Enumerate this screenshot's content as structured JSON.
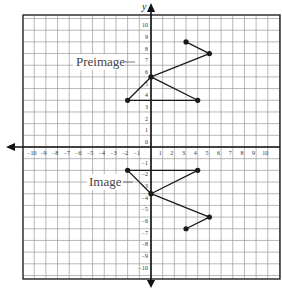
{
  "graph": {
    "x_axis_label": "",
    "y_axis_label": "y",
    "x_tick_labels": [
      "-10",
      "-9",
      "-8",
      "-7",
      "-6",
      "-5",
      "-4",
      "-3",
      "-2",
      "-1",
      "1",
      "2",
      "3",
      "4",
      "5",
      "6",
      "7",
      "8",
      "9",
      "10"
    ],
    "y_tick_labels_positive": [
      "10",
      "9",
      "8",
      "7",
      "6",
      "5",
      "4",
      "3",
      "2",
      "1",
      "0"
    ],
    "y_tick_labels_negative": [
      "-1",
      "-2",
      "-3",
      "-4",
      "-5",
      "-6",
      "-7",
      "-8",
      "-9",
      "-10"
    ],
    "preimage_label": "Preimage",
    "image_label": "Image",
    "line_color": "#1a1a1a",
    "grid_color": "#9a9a9a",
    "border_color": "#222222"
  },
  "chart_data": {
    "type": "line",
    "title": "",
    "xlabel": "",
    "ylabel": "y",
    "xlim": [
      -10,
      10
    ],
    "ylim": [
      -10,
      10
    ],
    "grid": true,
    "series": [
      {
        "name": "Preimage",
        "points": [
          [
            3,
            9
          ],
          [
            5,
            8
          ],
          [
            0,
            6
          ],
          [
            4,
            4
          ],
          [
            -2,
            4
          ],
          [
            0,
            6
          ]
        ]
      },
      {
        "name": "Image",
        "points": [
          [
            3,
            -7
          ],
          [
            5,
            -6
          ],
          [
            0,
            -4
          ],
          [
            4,
            -2
          ],
          [
            -2,
            -2
          ],
          [
            0,
            -4
          ]
        ]
      }
    ],
    "annotations": [
      "Preimage",
      "Image"
    ],
    "transformation": "reflection across the line y = 1"
  }
}
